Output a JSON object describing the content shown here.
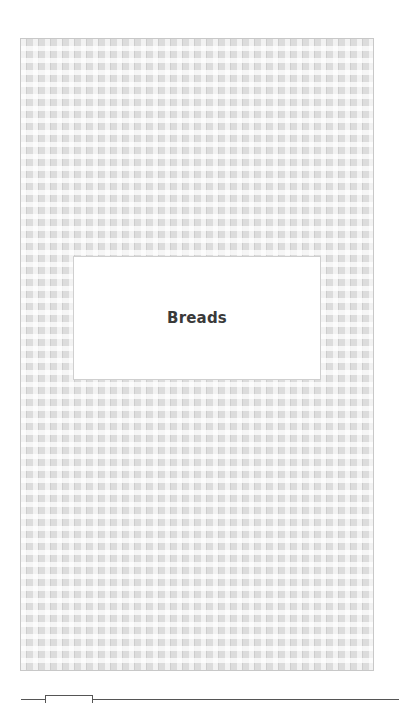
{
  "page": {
    "title": "Breads"
  },
  "colors": {
    "pattern_base": "#dcdcdc",
    "title_text": "#3a3a3a",
    "title_box_bg": "#ffffff"
  }
}
